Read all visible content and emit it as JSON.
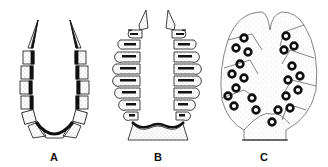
{
  "figure": {
    "panels": [
      {
        "id": "A",
        "label": "A",
        "center_x": 54
      },
      {
        "id": "B",
        "label": "B",
        "center_x": 158
      },
      {
        "id": "C",
        "label": "C",
        "center_x": 264
      }
    ]
  },
  "colors": {
    "ink": "#111111",
    "stipple": "#9a9a9a",
    "background": "#ffffff"
  }
}
